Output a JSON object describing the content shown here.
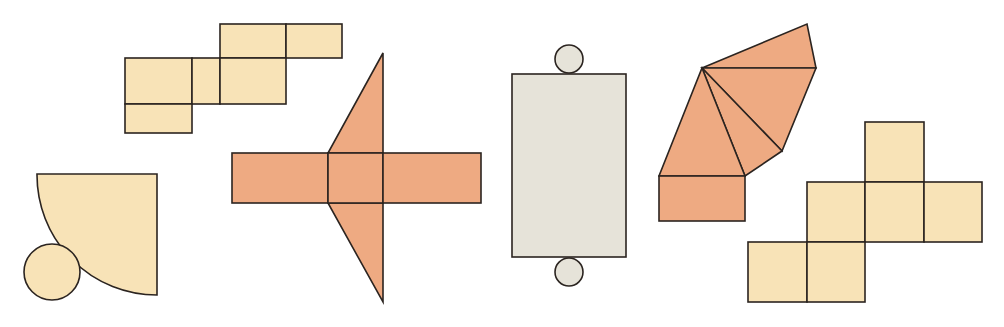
{
  "figure": {
    "colors": {
      "yellow": "#f8e3b7",
      "orange": "#eeaa82",
      "gray": "#e6e3d9",
      "stroke": "#2b2420",
      "background": "#ffffff"
    },
    "nets": [
      {
        "id": "cube-net-top",
        "shape": "net of rectangular prism (squares)",
        "color": "yellow"
      },
      {
        "id": "cone-net",
        "shape": "quarter-circle sector with circle base",
        "color": "yellow"
      },
      {
        "id": "triangular-prism-net",
        "shape": "three rectangles with two triangles",
        "color": "orange"
      },
      {
        "id": "cylinder-net",
        "shape": "rectangle with two circles",
        "color": "gray"
      },
      {
        "id": "pyramid-net",
        "shape": "rectangle base with four triangles",
        "color": "orange"
      },
      {
        "id": "cube-net-right",
        "shape": "six-square cube net",
        "color": "yellow"
      }
    ]
  }
}
